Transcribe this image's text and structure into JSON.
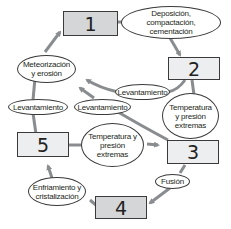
{
  "diagram": {
    "title": "",
    "colors": {
      "line": "#8a8d90",
      "box_dark": "#d4d6d8",
      "box_light": "#eceeef",
      "border": "#3a3a3a"
    },
    "nodes": [
      {
        "id": "1",
        "label": "1"
      },
      {
        "id": "2",
        "label": "2"
      },
      {
        "id": "3",
        "label": "3"
      },
      {
        "id": "4",
        "label": "4"
      },
      {
        "id": "5",
        "label": "5"
      }
    ],
    "processes": {
      "deposicion": "Deposición, compactación, cementación",
      "levantamiento_2": "Levantamiento",
      "temp_2_3": "Temperatura y presión extremas",
      "meteorizacion": "Meteorización y erosión",
      "levantamiento_left": "Levantamiento",
      "levantamiento_mid": "Levantamiento",
      "temp_5_3": "Temperatura y presión extremas",
      "fusion": "Fusión",
      "enfriamiento": "Enfriamiento y cristalización"
    },
    "edges": [
      {
        "from": "1",
        "to": "2",
        "via": "deposicion"
      },
      {
        "from": "2",
        "to": "meteorizacion",
        "via": "levantamiento_2"
      },
      {
        "from": "2",
        "to": "3",
        "via": "temp_2_3"
      },
      {
        "from": "meteorizacion",
        "to": "1"
      },
      {
        "from": "5",
        "to": "meteorizacion",
        "via": "levantamiento_left"
      },
      {
        "from": "3",
        "to": "meteorizacion",
        "via": "levantamiento_mid"
      },
      {
        "from": "5",
        "to": "3",
        "via": "temp_5_3"
      },
      {
        "from": "3",
        "to": "4",
        "via": "fusion"
      },
      {
        "from": "4",
        "to": "5",
        "via": "enfriamiento"
      }
    ]
  }
}
